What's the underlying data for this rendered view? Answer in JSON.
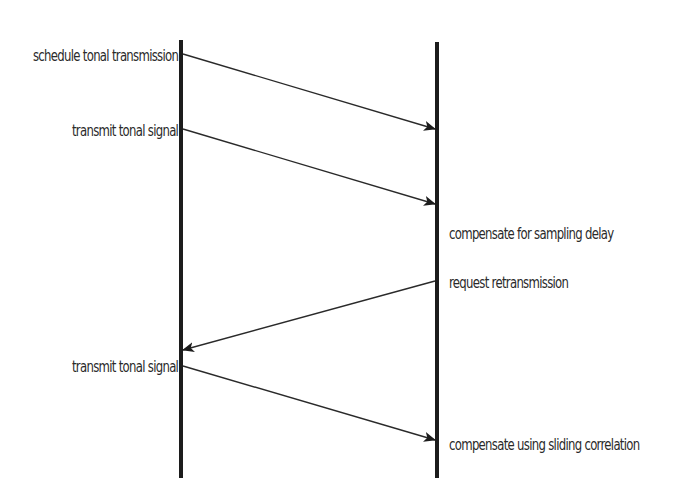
{
  "diagram": {
    "type": "sequence",
    "colors": {
      "line": "#1c1c1c",
      "text": "#2a2a2a",
      "background": "#ffffff"
    },
    "lifelines": [
      {
        "id": "left",
        "x": 181,
        "y1": 40,
        "y2": 478
      },
      {
        "id": "right",
        "x": 437,
        "y1": 42,
        "y2": 478
      }
    ],
    "messages": [
      {
        "from": "left",
        "to": "right",
        "x1": 183,
        "y1": 54,
        "x2": 435,
        "y2": 129
      },
      {
        "from": "left",
        "to": "right",
        "x1": 183,
        "y1": 129,
        "x2": 435,
        "y2": 204
      },
      {
        "from": "right",
        "to": "left",
        "x1": 435,
        "y1": 281,
        "x2": 183,
        "y2": 350
      },
      {
        "from": "left",
        "to": "right",
        "x1": 183,
        "y1": 366,
        "x2": 435,
        "y2": 440
      }
    ],
    "left_labels": [
      {
        "text": "schedule tonal transmission",
        "y": 47
      },
      {
        "text": "transmit tonal signal",
        "y": 122
      },
      {
        "text": "transmit tonal signal",
        "y": 358
      }
    ],
    "right_labels": [
      {
        "text": "compensate for sampling delay",
        "y": 225
      },
      {
        "text": "request retransmission",
        "y": 274
      },
      {
        "text": "compensate using sliding correlation",
        "y": 436
      }
    ]
  }
}
